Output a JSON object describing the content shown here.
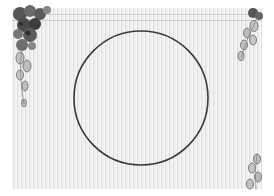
{
  "scene": {
    "description": "Decorative greyscale stationery frame with striped paper, floral corner ornaments and a central circular outline",
    "colors": {
      "page_background": "#ffffff",
      "paper": "#ececec",
      "circle_stroke": "#3a3a3a",
      "flower_dark": "#4a4a4a",
      "flower_mid": "#7a7a7a",
      "bud_light": "#b8b8b8"
    },
    "circle": {
      "cx": 141,
      "cy": 98,
      "r": 67,
      "stroke_width": 1.6
    },
    "ornaments": [
      {
        "name": "top-left-flower-cluster",
        "position": "top-left"
      },
      {
        "name": "top-right-bud-branch",
        "position": "top-right"
      },
      {
        "name": "bottom-right-bud-branch",
        "position": "bottom-right"
      }
    ]
  }
}
